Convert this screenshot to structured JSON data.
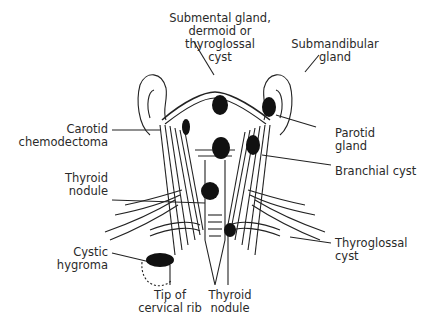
{
  "diagram": {
    "labels": {
      "submental": [
        "Submental gland,",
        "dermoid or",
        "thyroglossal",
        "cyst"
      ],
      "submandibular": [
        "Submandibular",
        "gland"
      ],
      "carotid": [
        "Carotid",
        "chemodectoma"
      ],
      "parotid": [
        "Parotid",
        "gland"
      ],
      "branchial": [
        "Branchial cyst"
      ],
      "thyroid_left": [
        "Thyroid",
        "nodule"
      ],
      "cystic_hygroma": [
        "Cystic",
        "hygroma"
      ],
      "thyroglossal": [
        "Thyroglossal",
        "cyst"
      ],
      "cervical_rib": [
        "Tip of",
        "cervical rib"
      ],
      "thyroid_bottom": [
        "Thyroid",
        "nodule"
      ]
    }
  }
}
